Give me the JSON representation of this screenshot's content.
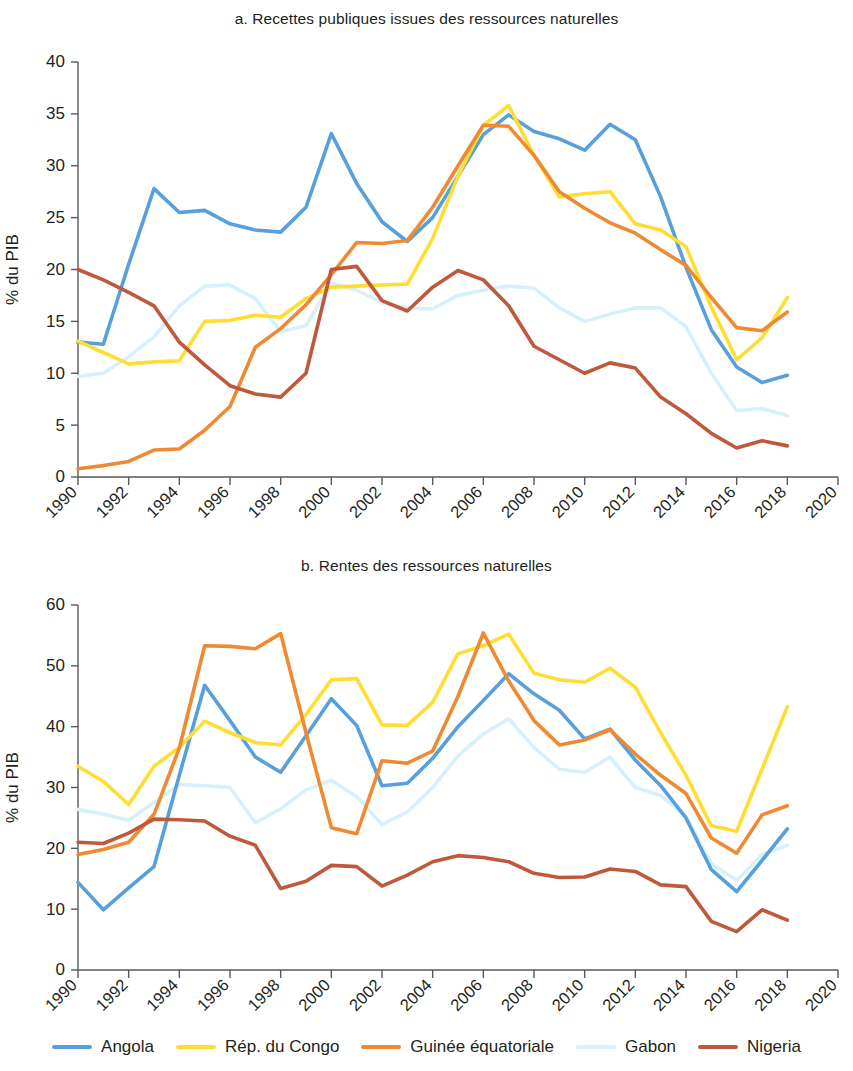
{
  "figure": {
    "y_axis_label": "% du PIB"
  },
  "legend": {
    "items": [
      {
        "label": "Angola",
        "color": "#57a0dd"
      },
      {
        "label": "Rép. du Congo",
        "color": "#ffdd33"
      },
      {
        "label": "Guinée équatoriale",
        "color": "#ef8a33"
      },
      {
        "label": "Gabon",
        "color": "#d6f1fa"
      },
      {
        "label": "Nigeria",
        "color": "#c0583c"
      }
    ]
  },
  "chart_data": [
    {
      "type": "line",
      "id": "panel-a",
      "title": "a. Recettes publiques issues des ressources naturelles",
      "xlabel": "",
      "ylabel": "% du PIB",
      "xlim": [
        1990,
        2020
      ],
      "ylim": [
        0,
        40
      ],
      "ytick_step": 5,
      "yticks": [
        0,
        5,
        10,
        15,
        20,
        25,
        30,
        35,
        40
      ],
      "xticks": [
        1990,
        1992,
        1994,
        1996,
        1998,
        2000,
        2002,
        2004,
        2006,
        2008,
        2010,
        2012,
        2014,
        2016,
        2018,
        2020
      ],
      "x": [
        1990,
        1991,
        1992,
        1993,
        1994,
        1995,
        1996,
        1997,
        1998,
        1999,
        2000,
        2001,
        2002,
        2003,
        2004,
        2005,
        2006,
        2007,
        2008,
        2009,
        2010,
        2011,
        2012,
        2013,
        2014,
        2015,
        2016,
        2017,
        2018
      ],
      "grid": false,
      "legend_position": "bottom",
      "series": [
        {
          "name": "Angola",
          "color": "#57a0dd",
          "values": [
            13.0,
            12.8,
            20.5,
            27.8,
            25.5,
            25.7,
            24.4,
            23.8,
            23.6,
            26.0,
            33.1,
            28.3,
            24.6,
            22.7,
            25.0,
            29.0,
            33.0,
            34.9,
            33.3,
            32.6,
            31.5,
            34.0,
            32.5,
            27.0,
            20.2,
            14.2,
            10.6,
            9.1,
            9.8
          ]
        },
        {
          "name": "Rép. du Congo",
          "color": "#ffdd33",
          "values": [
            13.1,
            12.0,
            10.9,
            11.1,
            11.2,
            15.0,
            15.1,
            15.6,
            15.4,
            17.2,
            18.3,
            18.4,
            18.5,
            18.6,
            23.0,
            29.0,
            33.9,
            35.8,
            31.0,
            27.0,
            27.3,
            27.5,
            24.4,
            23.8,
            22.2,
            16.4,
            11.3,
            13.4,
            17.3
          ]
        },
        {
          "name": "Guinée équatoriale",
          "color": "#ef8a33",
          "values": [
            0.8,
            1.1,
            1.5,
            2.6,
            2.7,
            4.5,
            6.8,
            12.5,
            14.3,
            16.6,
            19.5,
            22.6,
            22.5,
            22.8,
            26.0,
            30.0,
            33.9,
            33.8,
            31.0,
            27.5,
            25.9,
            24.5,
            23.5,
            21.9,
            20.4,
            17.3,
            14.4,
            14.1,
            15.9
          ]
        },
        {
          "name": "Gabon",
          "color": "#d6f1fa",
          "values": [
            9.7,
            10.0,
            11.6,
            13.5,
            16.5,
            18.4,
            18.5,
            17.2,
            14.0,
            14.6,
            18.7,
            18.0,
            16.8,
            16.3,
            16.2,
            17.5,
            18.0,
            18.4,
            18.2,
            16.3,
            15.0,
            15.7,
            16.3,
            16.3,
            14.5,
            10.0,
            6.4,
            6.6,
            5.9
          ]
        },
        {
          "name": "Nigeria",
          "color": "#c0583c",
          "values": [
            20.0,
            19.0,
            17.8,
            16.5,
            13.0,
            10.8,
            8.8,
            8.0,
            7.7,
            10.0,
            20.0,
            20.3,
            17.0,
            16.0,
            18.3,
            19.9,
            19.0,
            16.5,
            12.6,
            11.3,
            10.0,
            11.0,
            10.5,
            7.7,
            6.1,
            4.2,
            2.8,
            3.5,
            3.0
          ]
        }
      ]
    },
    {
      "type": "line",
      "id": "panel-b",
      "title": "b. Rentes des ressources naturelles",
      "xlabel": "",
      "ylabel": "% du PIB",
      "xlim": [
        1990,
        2020
      ],
      "ylim": [
        0,
        60
      ],
      "ytick_step": 10,
      "yticks": [
        0,
        10,
        20,
        30,
        40,
        50,
        60
      ],
      "xticks": [
        1990,
        1992,
        1994,
        1996,
        1998,
        2000,
        2002,
        2004,
        2006,
        2008,
        2010,
        2012,
        2014,
        2016,
        2018,
        2020
      ],
      "x": [
        1990,
        1991,
        1992,
        1993,
        1994,
        1995,
        1996,
        1997,
        1998,
        1999,
        2000,
        2001,
        2002,
        2003,
        2004,
        2005,
        2006,
        2007,
        2008,
        2009,
        2010,
        2011,
        2012,
        2013,
        2014,
        2015,
        2016,
        2017,
        2018
      ],
      "grid": false,
      "legend_position": "bottom",
      "series": [
        {
          "name": "Angola",
          "color": "#57a0dd",
          "values": [
            14.4,
            9.9,
            13.5,
            17.0,
            32.0,
            46.8,
            41.0,
            35.0,
            32.5,
            38.5,
            44.6,
            40.2,
            30.3,
            30.7,
            34.8,
            40.0,
            44.3,
            48.7,
            45.4,
            42.7,
            38.0,
            39.6,
            34.5,
            30.3,
            25.0,
            16.5,
            12.9,
            18.0,
            23.2
          ]
        },
        {
          "name": "Rép. du Congo",
          "color": "#ffdd33",
          "values": [
            33.5,
            31.0,
            27.2,
            33.5,
            36.6,
            40.9,
            39.0,
            37.4,
            37.0,
            42.0,
            47.7,
            47.9,
            40.3,
            40.2,
            44.0,
            52.0,
            53.3,
            55.2,
            48.8,
            47.7,
            47.3,
            49.6,
            46.5,
            39.0,
            32.0,
            23.7,
            22.8,
            33.0,
            43.3
          ]
        },
        {
          "name": "Guinée équatoriale",
          "color": "#ef8a33",
          "values": [
            19.0,
            19.8,
            21.0,
            25.6,
            36.5,
            53.3,
            53.2,
            52.8,
            55.3,
            39.0,
            23.4,
            22.4,
            34.4,
            34.0,
            36.0,
            45.0,
            55.4,
            47.5,
            41.0,
            37.0,
            37.8,
            39.5,
            35.5,
            32.0,
            29.0,
            21.7,
            19.2,
            25.5,
            27.0
          ]
        },
        {
          "name": "Gabon",
          "color": "#d6f1fa",
          "values": [
            26.4,
            25.6,
            24.6,
            27.5,
            30.5,
            30.3,
            30.0,
            24.2,
            26.5,
            29.6,
            31.2,
            28.5,
            23.9,
            26.0,
            30.0,
            35.2,
            38.8,
            41.3,
            36.6,
            33.0,
            32.5,
            35.0,
            30.0,
            28.7,
            25.2,
            17.5,
            14.7,
            19.0,
            20.5
          ]
        },
        {
          "name": "Nigeria",
          "color": "#c0583c",
          "values": [
            21.0,
            20.8,
            22.5,
            24.8,
            24.7,
            24.5,
            22.0,
            20.5,
            13.4,
            14.6,
            17.2,
            17.0,
            13.8,
            15.6,
            17.8,
            18.8,
            18.5,
            17.8,
            15.9,
            15.2,
            15.3,
            16.6,
            16.2,
            14.0,
            13.7,
            8.0,
            6.3,
            9.9,
            8.2
          ]
        }
      ]
    }
  ]
}
